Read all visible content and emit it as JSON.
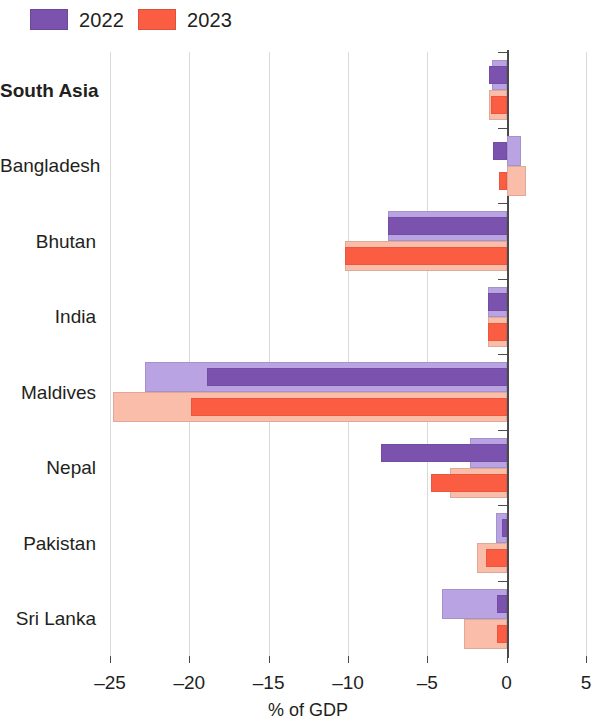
{
  "legend": {
    "items": [
      {
        "label": "2022",
        "color": "#7b52ae",
        "light_color": "#b9a3e3"
      },
      {
        "label": "2023",
        "color": "#fa5d42",
        "light_color": "#f9bda9"
      }
    ]
  },
  "chart_data": {
    "type": "bar",
    "orientation": "horizontal",
    "title": "",
    "xlabel": "% of GDP",
    "ylabel": "",
    "xlim": [
      -25,
      5
    ],
    "xticks": [
      -25,
      -20,
      -15,
      -10,
      -5,
      0,
      5
    ],
    "xtick_labels": [
      "–25",
      "–20",
      "–15",
      "–10",
      "–5",
      "0",
      "5"
    ],
    "grid": "vertical",
    "legend_position": "top-left",
    "categories": [
      "South Asia",
      "Bangladesh",
      "Bhutan",
      "India",
      "Maldives",
      "Nepal",
      "Pakistan",
      "Sri Lanka"
    ],
    "bold_categories": [
      "South Asia"
    ],
    "series": [
      {
        "name": "2022",
        "variant": "outer",
        "color": "#b9a3e3",
        "values": [
          -0.9,
          0.9,
          -7.5,
          -1.2,
          -22.8,
          -2.3,
          -0.7,
          -4.1
        ]
      },
      {
        "name": "2022",
        "variant": "inner",
        "color": "#7b52ae",
        "values": [
          -1.1,
          -0.85,
          -7.5,
          -1.2,
          -18.9,
          -7.9,
          -0.3,
          -0.6
        ]
      },
      {
        "name": "2023",
        "variant": "outer",
        "color": "#f9bda9",
        "values": [
          -1.1,
          1.2,
          -10.2,
          -1.2,
          -24.8,
          -3.6,
          -1.9,
          -2.7
        ]
      },
      {
        "name": "2023",
        "variant": "inner",
        "color": "#fa5d42",
        "values": [
          -1.0,
          -0.5,
          -10.2,
          -1.2,
          -19.9,
          -4.8,
          -1.3,
          -0.6
        ]
      }
    ]
  }
}
